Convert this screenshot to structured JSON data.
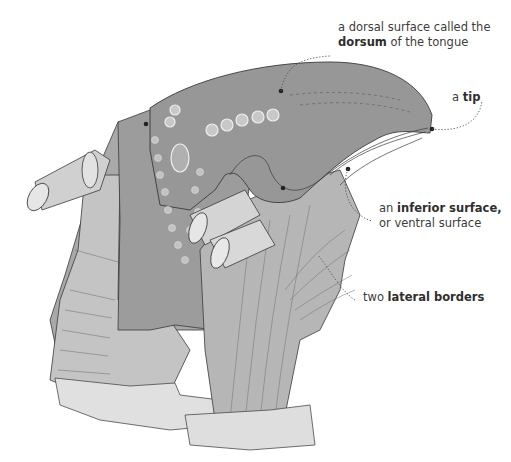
{
  "diagram": {
    "labels": [
      {
        "id": "dorsum",
        "line1": "a dorsal surface called the",
        "bold": "dorsum",
        "line2_rest": " of the tongue"
      },
      {
        "id": "tip",
        "prefix": "a ",
        "bold": "tip"
      },
      {
        "id": "inferior",
        "prefix": "an ",
        "bold": "inferior surface,",
        "line2": "or ventral surface"
      },
      {
        "id": "lateral",
        "prefix": "two ",
        "bold": "lateral borders"
      }
    ],
    "colors": {
      "tongue_fill": "#9a9a9a",
      "muscle_fill": "#b8b8b8",
      "bone_fill": "#dcdcdc",
      "outline": "#3a3a3a",
      "leader_dots": "#555555",
      "text": "#3c3c3c"
    }
  }
}
